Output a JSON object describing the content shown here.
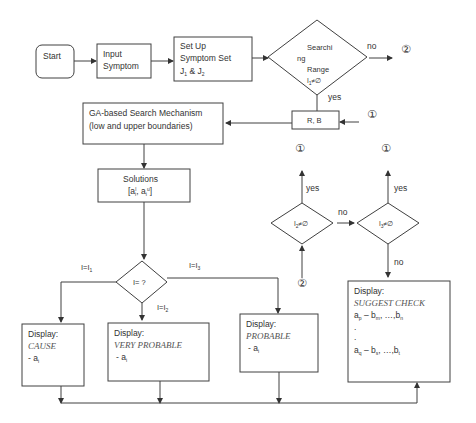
{
  "diagram": {
    "nodes": {
      "start": "Start",
      "input_line1": "Input",
      "input_line2": "Symptom",
      "setup_line1": "Set Up",
      "setup_line2": "Symptom Set",
      "setup_line3": "J",
      "setup_sub1": "1",
      "setup_amp": " & J",
      "setup_sub2": "2",
      "range_line1": "Searchi",
      "range_line2": "ng",
      "range_line3": "Range",
      "range_cond": "I",
      "range_cond_sub": "1",
      "range_cond_rest": "≠∅",
      "rb": "R, B",
      "ga_line1": "GA-based Search Mechanism",
      "ga_line2": "(low and upper boundaries)",
      "solutions_line1": "Solutions",
      "solutions_line2": "[a",
      "solutions_sub1": "i",
      "solutions_sup1": "l",
      "solutions_mid": ", a",
      "solutions_sub2": "i",
      "solutions_sup2": "u",
      "solutions_end": "]",
      "i_decision": "I= ?",
      "i2_cond": "I",
      "i2_sub": "2",
      "i2_rest": "≠∅",
      "i3_cond": "I",
      "i3_sub": "3",
      "i3_rest": "≠∅",
      "cause_title": "Display:",
      "cause_label": "CAUSE",
      "cause_item": "- a",
      "cause_item_sub": "i",
      "very_title": "Display:",
      "very_label": "VERY PROBABLE",
      "very_item": "- a",
      "very_item_sub": "i",
      "prob_title": "Display:",
      "prob_label": "PROBABLE",
      "prob_item": "- a",
      "prob_item_sub": "i",
      "suggest_title": "Display:",
      "suggest_label": "SUGGEST CHECK",
      "suggest_line1_a": "a",
      "suggest_line1_asub": "p",
      "suggest_line1_b": " – b",
      "suggest_line1_bsub": "m",
      "suggest_line1_c": ", …,b",
      "suggest_line1_csub": "n",
      "suggest_dot1": ".",
      "suggest_dot2": ".",
      "suggest_line2_a": "a",
      "suggest_line2_asub": "q",
      "suggest_line2_b": " – b",
      "suggest_line2_bsub": "s",
      "suggest_line2_c": ", …,b",
      "suggest_line2_csub": "t"
    },
    "edge_labels": {
      "range_no": "no",
      "range_yes": "yes",
      "i2_yes": "yes",
      "i2_no": "no",
      "i3_yes": "yes",
      "i3_no": "no",
      "branch_i1": "I=I",
      "branch_i1_sub": "1",
      "branch_i2": "I=I",
      "branch_i2_sub": "2",
      "branch_i3": "I=I",
      "branch_i3_sub": "3"
    },
    "connectors": {
      "c1": "①",
      "c2": "②"
    }
  }
}
